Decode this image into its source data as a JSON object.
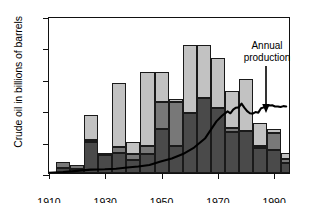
{
  "chart_data": {
    "type": "bar",
    "title": "",
    "subtitle": "",
    "xlabel": "",
    "ylabel": "Crude oil in billions of barrels",
    "xlim": [
      1910,
      1996
    ],
    "ylim": [
      0,
      50
    ],
    "grid": false,
    "legend_position": "none",
    "y_ticks": [
      0,
      10,
      20,
      30,
      40,
      50
    ],
    "y_tick_labels": [
      "0",
      "10",
      "20",
      "30",
      "40",
      "50"
    ],
    "x_ticks": [
      1910,
      1930,
      1950,
      1970,
      1990
    ],
    "x_tick_labels": [
      "1910",
      "1930",
      "1950",
      "1970",
      "1990"
    ],
    "categories": [
      1915,
      1920,
      1925,
      1930,
      1935,
      1940,
      1945,
      1950,
      1955,
      1960,
      1965,
      1970,
      1975,
      1980,
      1985,
      1990,
      1995
    ],
    "bar_width_years": 5,
    "stacked": true,
    "series": [
      {
        "name": "lower-segment",
        "color": "#4a4a4a",
        "values": [
          1.5,
          1.3,
          9.8,
          5.8,
          6.3,
          4.2,
          6.0,
          14.0,
          8.5,
          19.2,
          23.8,
          20.6,
          13.2,
          13.4,
          8.0,
          7.4,
          3.2
        ]
      },
      {
        "name": "middle-segment",
        "color": "#787878",
        "values": [
          2.0,
          1.2,
          0.7,
          0.2,
          1.9,
          1.7,
          2.7,
          8.5,
          14.0,
          0.0,
          0.0,
          0.0,
          1.0,
          0.0,
          0.5,
          5.2,
          1.2
        ]
      },
      {
        "name": "upper-segment",
        "color": "#c2c2c2",
        "values": [
          0.0,
          0.0,
          8.0,
          0.0,
          20.5,
          4.1,
          23.6,
          9.8,
          1.1,
          21.5,
          17.0,
          16.0,
          11.9,
          16.7,
          7.4,
          1.4,
          2.0
        ]
      }
    ],
    "bar_totals": [
      3.5,
      2.5,
      18.5,
      6.0,
      28.7,
      10.0,
      32.3,
      32.3,
      23.6,
      40.7,
      40.8,
      36.6,
      26.1,
      30.1,
      15.9,
      14.0,
      6.4
    ],
    "annotations": [
      {
        "name": "annual-production",
        "text_line1": "Annual",
        "text_line2": "production",
        "arrow": "down",
        "points_to_year": 1986,
        "points_to_value": 21.5
      }
    ],
    "overlay_line": {
      "name": "Annual production",
      "color": "#000000",
      "x": [
        1910,
        1915,
        1920,
        1925,
        1930,
        1934,
        1938,
        1942,
        1946,
        1950,
        1954,
        1958,
        1962,
        1966,
        1970,
        1972,
        1974,
        1975,
        1976,
        1977,
        1978,
        1979,
        1980,
        1981,
        1982,
        1983,
        1984,
        1985,
        1986,
        1987,
        1988,
        1989,
        1990,
        1991,
        1992,
        1993,
        1994,
        1995
      ],
      "y": [
        0.3,
        0.5,
        0.9,
        1.3,
        1.4,
        1.6,
        2.0,
        2.3,
        2.8,
        3.9,
        4.9,
        6.3,
        8.4,
        11.4,
        16.8,
        18.6,
        20.0,
        19.4,
        20.6,
        21.2,
        21.3,
        22.5,
        21.2,
        20.1,
        19.4,
        19.3,
        19.8,
        19.6,
        21.0,
        21.3,
        22.0,
        21.9,
        22.0,
        21.6,
        21.6,
        21.4,
        21.7,
        21.6
      ]
    }
  }
}
